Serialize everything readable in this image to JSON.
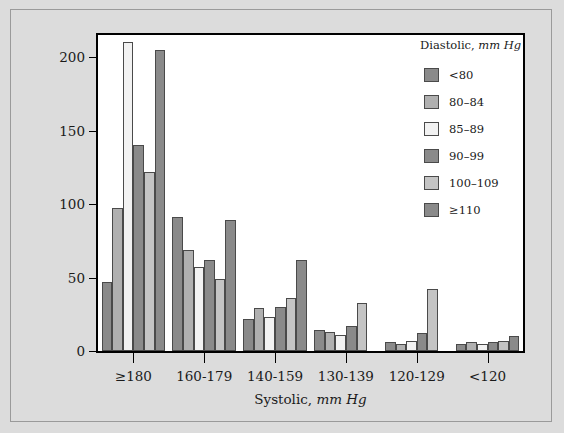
{
  "chart_data": {
    "type": "bar",
    "title": "",
    "xlabel": "Systolic, mm Hg",
    "xlabel_text": "Systolic,",
    "xlabel_units": "mm Hg",
    "ylabel": "",
    "ylim": [
      0,
      215
    ],
    "yticks": [
      0,
      50,
      100,
      150,
      200
    ],
    "grid": false,
    "legend_position": "top-right",
    "legend_title_text": "Diastolic,",
    "legend_title_units": "mm Hg",
    "categories": [
      "≥180",
      "160-179",
      "140-159",
      "130-139",
      "120-129",
      "<120"
    ],
    "series": [
      {
        "name": "<80",
        "color": "#8a8a8a",
        "values": [
          47,
          91,
          22,
          14,
          6,
          5
        ]
      },
      {
        "name": "80–84",
        "color": "#b0b0b0",
        "values": [
          97,
          69,
          29,
          13,
          5,
          6
        ]
      },
      {
        "name": "85–89",
        "color": "#f2f2f2",
        "values": [
          210,
          57,
          23,
          11,
          7,
          5
        ]
      },
      {
        "name": "90–99",
        "color": "#8a8a8a",
        "values": [
          140,
          62,
          30,
          17,
          12,
          6
        ]
      },
      {
        "name": "100–109",
        "color": "#c4c4c4",
        "values": [
          122,
          49,
          36,
          33,
          42,
          7
        ]
      },
      {
        "name": "≥110",
        "color": "#8a8a8a",
        "values": [
          205,
          89,
          62,
          0,
          0,
          10
        ]
      }
    ]
  },
  "colors": {
    "page_background": "#dcdcdc",
    "plot_background": "#ffffff",
    "axis": "#000000",
    "bar_outline": "#4a4a4a"
  }
}
